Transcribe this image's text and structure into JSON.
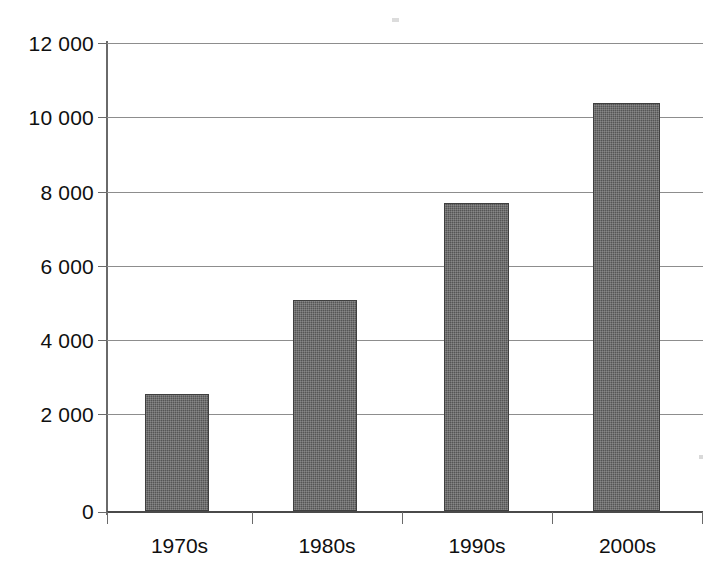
{
  "chart_data": {
    "type": "bar",
    "title": "",
    "subtitle": "",
    "xlabel": "",
    "ylabel": "",
    "categories": [
      "1970s",
      "1980s",
      "1990s",
      "2000s"
    ],
    "values": [
      3000,
      5400,
      7900,
      10450
    ],
    "series": [
      {
        "name": "",
        "values": [
          3000,
          5400,
          7900,
          10450
        ]
      }
    ],
    "ylim": [
      0,
      12000
    ],
    "y_ticks": [
      0,
      2000,
      4000,
      6000,
      8000,
      10000,
      12000
    ],
    "y_tick_labels": [
      "0",
      "2 000",
      "4 000",
      "6 000",
      "8 000",
      "10 000",
      "12 000"
    ],
    "grid": true,
    "grid_axis": "y",
    "legend": false,
    "legend_position": "none",
    "bar_color": "#555555",
    "grid_color": "#8d8d8d",
    "axis_color": "#6a6a6a",
    "background": "#ffffff",
    "annotations": []
  },
  "axes": {
    "y_labels": [
      {
        "text": "12 000",
        "value": 12000
      },
      {
        "text": "10 000",
        "value": 10000
      },
      {
        "text": "8 000",
        "value": 8000
      },
      {
        "text": "6 000",
        "value": 6000
      },
      {
        "text": "4 000",
        "value": 4000
      },
      {
        "text": "2 000",
        "value": 2000
      },
      {
        "text": "0",
        "value": 0
      }
    ],
    "x_labels": [
      {
        "text": "1970s"
      },
      {
        "text": "1980s"
      },
      {
        "text": "1990s"
      },
      {
        "text": "2000s"
      }
    ]
  }
}
